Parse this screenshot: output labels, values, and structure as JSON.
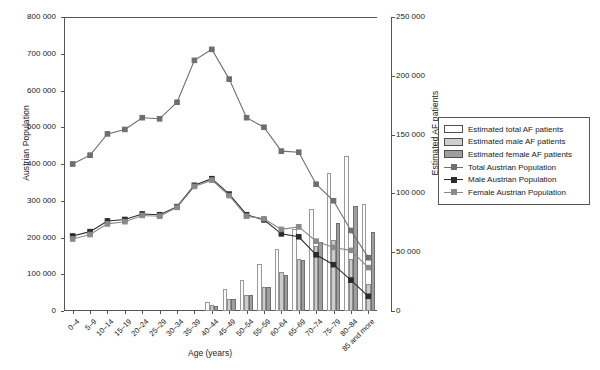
{
  "chart_data": {
    "type": "bar",
    "title": "",
    "xlabel": "Age (years)",
    "ylabel": "Austrian Population",
    "ylabel_right": "Estimated AF patients",
    "categories": [
      "0–4",
      "5–9",
      "10–14",
      "15–19",
      "20–24",
      "25–29",
      "30–34",
      "35–39",
      "40–44",
      "45–49",
      "50–54",
      "55–59",
      "60–64",
      "65–69",
      "70–74",
      "75–79",
      "80–84",
      "85 and more"
    ],
    "ylim": [
      0,
      800000
    ],
    "yticks": [
      "0",
      "100 000",
      "200 000",
      "300 000",
      "400 000",
      "500 000",
      "600 000",
      "700 000",
      "800 000"
    ],
    "ylim_right": [
      0,
      250000
    ],
    "yticks_right": [
      "0",
      "50 000",
      "100 000",
      "150 000",
      "200 000",
      "250 000"
    ],
    "grid": false,
    "legend_position": "right",
    "series": [
      {
        "name": "Estimated total AF patients",
        "kind": "bar",
        "axis": "right",
        "color": "#fbfbfb",
        "values": [
          0,
          0,
          0,
          0,
          0,
          0,
          0,
          0,
          7500,
          19000,
          26000,
          40000,
          53000,
          70000,
          87000,
          117000,
          132000,
          91000
        ]
      },
      {
        "name": "Estimated male AF patients",
        "kind": "bar",
        "axis": "right",
        "color": "#cccccc",
        "values": [
          0,
          0,
          0,
          0,
          0,
          0,
          0,
          0,
          5000,
          10000,
          13500,
          20000,
          33000,
          44000,
          55000,
          60000,
          44000,
          23000
        ]
      },
      {
        "name": "Estimated female AF patients",
        "kind": "bar",
        "axis": "right",
        "color": "#9e9e9e",
        "values": [
          0,
          0,
          0,
          0,
          0,
          0,
          0,
          0,
          4500,
          10000,
          14000,
          20000,
          31000,
          43000,
          59000,
          75000,
          89000,
          67000
        ]
      },
      {
        "name": "Total Austrian Population",
        "kind": "line",
        "axis": "left",
        "color": "#6e6e6e",
        "values": [
          400000,
          424000,
          482000,
          494000,
          526000,
          523000,
          568000,
          682000,
          712000,
          631000,
          526000,
          500000,
          435000,
          432000,
          345000,
          300000,
          219000,
          145000
        ]
      },
      {
        "name": "Male Austrian Population",
        "kind": "line",
        "axis": "left",
        "color": "#2b2b2b",
        "values": [
          204000,
          216000,
          245000,
          249000,
          264000,
          262000,
          284000,
          342000,
          360000,
          318000,
          262000,
          248000,
          210000,
          202000,
          153000,
          126000,
          84000,
          40000
        ]
      },
      {
        "name": "Female Austrian Population",
        "kind": "line",
        "axis": "left",
        "color": "#8a8a8a",
        "values": [
          196000,
          208000,
          237000,
          243000,
          260000,
          258000,
          282000,
          339000,
          356000,
          314000,
          258000,
          251000,
          222000,
          229000,
          190000,
          173000,
          165000,
          118000
        ]
      }
    ]
  },
  "legend": {
    "items": [
      {
        "label": "Estimated total AF patients",
        "swatch": "total",
        "kind": "bar"
      },
      {
        "label": "Estimated male AF patients",
        "swatch": "male",
        "kind": "bar"
      },
      {
        "label": "Estimated female AF patients",
        "swatch": "female",
        "kind": "bar"
      },
      {
        "label": "Total Austrian Population",
        "swatch": "#6e6e6e",
        "kind": "line"
      },
      {
        "label": "Male Austrian Population",
        "swatch": "#2b2b2b",
        "kind": "line"
      },
      {
        "label": "Female Austrian Population",
        "swatch": "#8a8a8a",
        "kind": "line"
      }
    ]
  }
}
